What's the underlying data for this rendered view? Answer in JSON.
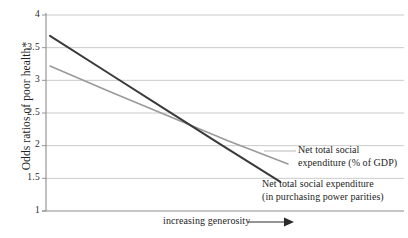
{
  "chart_data": {
    "type": "line",
    "title": "",
    "xlabel": "increasing generosity",
    "ylabel": "Odds ratios of poor health*",
    "ylim": [
      1,
      4
    ],
    "yticks": [
      "4",
      "3.5",
      "3",
      "2.5",
      "2",
      "1.5",
      "1"
    ],
    "ytick_values": [
      4,
      3.5,
      3,
      2.5,
      2,
      1.5,
      1
    ],
    "xticks": [],
    "grid": "horizontal",
    "legend_position": "inline-annotations",
    "series": [
      {
        "name": "Net total social expenditure (in purchasing power parities)",
        "color": "#3a3a3a",
        "x": [
          0,
          0.25,
          0.5,
          0.75,
          1
        ],
        "values": [
          3.68,
          3.12,
          2.56,
          2.0,
          1.45
        ]
      },
      {
        "name": "Net total social expenditure (% of GDP)",
        "color": "#9a9a9a",
        "x": [
          0,
          0.25,
          0.5,
          0.75,
          1
        ],
        "values": [
          3.22,
          2.83,
          2.45,
          2.07,
          1.72
        ]
      }
    ],
    "annotations": [
      {
        "name": "net-total-social-expenditure-gdp",
        "line1": "Net total social",
        "line2": "expenditure (% of GDP)"
      },
      {
        "name": "net-total-social-expenditure-ppp",
        "line1": "Net total social expenditure",
        "line2": "(in purchasing power parities)"
      }
    ]
  },
  "axis": {
    "y_title": "Odds ratios of poor health*",
    "x_caption": "increasing generosity",
    "y_tick_labels": [
      "4",
      "3.5",
      "3",
      "2.5",
      "2",
      "1.5",
      "1"
    ]
  },
  "colors": {
    "dark_series": "#3a3a3a",
    "light_series": "#9a9a9a",
    "gridline": "#b8b8b8",
    "axis": "#8c8c8c",
    "text": "#1d1d1d"
  }
}
